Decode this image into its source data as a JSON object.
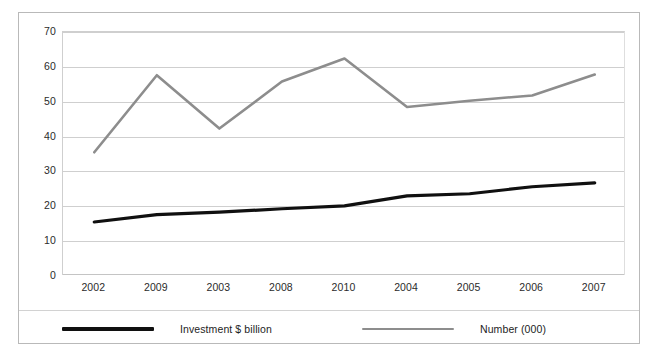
{
  "chart_data": {
    "type": "line",
    "title": "",
    "xlabel": "",
    "ylabel": "",
    "ylim": [
      0,
      70
    ],
    "ytick_step": 10,
    "yticks": [
      "70",
      "60",
      "50",
      "40",
      "30",
      "20",
      "10",
      "0"
    ],
    "grid": true,
    "legend_position": "bottom",
    "categories": [
      "2002",
      "2009",
      "2003",
      "2008",
      "2010",
      "2004",
      "2005",
      "2006",
      "2007"
    ],
    "series": [
      {
        "name": "Investment $ billion",
        "color": "#101010",
        "values": [
          15.5,
          17.6,
          18.3,
          19.3,
          20.1,
          23.0,
          23.6,
          25.6,
          26.7
        ]
      },
      {
        "name": "Number (000)",
        "color": "#8d8d8d",
        "values": [
          35.5,
          57.6,
          42.3,
          55.8,
          62.4,
          48.5,
          50.3,
          51.8,
          57.8
        ]
      }
    ]
  },
  "legend": {
    "entries": [
      {
        "label": "Investment $ billion"
      },
      {
        "label": "Number (000)"
      }
    ]
  },
  "colors": {
    "investment_line": "#101010",
    "number_line": "#8d8d8d",
    "gridline": "#cfcfcf",
    "border": "#b9b9b9",
    "text": "#2b2b2b"
  }
}
